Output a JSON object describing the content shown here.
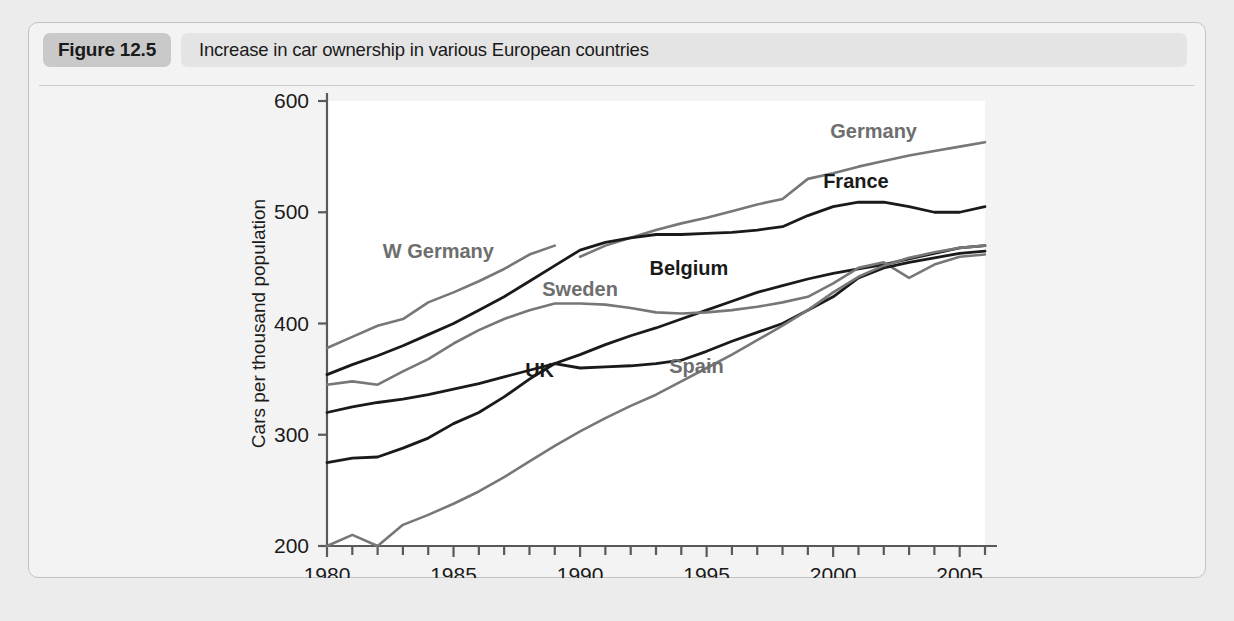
{
  "figure": {
    "tag": "Figure 12.5",
    "title": "Increase in car ownership in various European countries"
  },
  "chart_data": {
    "type": "line",
    "title": "Increase in car ownership in various European countries",
    "xlabel": "",
    "ylabel": "Cars per thousand population",
    "xlim": [
      1980,
      2006
    ],
    "ylim": [
      200,
      600
    ],
    "yticks": [
      200,
      300,
      400,
      500,
      600
    ],
    "ytick_labels": [
      "200",
      "300",
      "400",
      "500",
      "600"
    ],
    "xticks": [
      1980,
      1985,
      1990,
      1995,
      2000,
      2005
    ],
    "xtick_labels": [
      "1980",
      "1985",
      "1990",
      "1995",
      "2000",
      "2005"
    ],
    "xtick_minor_step": 1,
    "grid": false,
    "legend": "inline-labels",
    "colors": {
      "dark": "#1a1a1a",
      "gray": "#777777"
    },
    "series": [
      {
        "name": "W Germany",
        "color": "gray",
        "label_x": 1984.4,
        "label_y": 465,
        "x": [
          1980,
          1981,
          1982,
          1983,
          1984,
          1985,
          1986,
          1987,
          1988,
          1989
        ],
        "values": [
          378,
          388,
          398,
          404,
          419,
          428,
          438,
          449,
          462,
          470
        ]
      },
      {
        "name": "Germany",
        "color": "gray",
        "label_x": 2001.6,
        "label_y": 573,
        "x": [
          1990,
          1991,
          1992,
          1993,
          1994,
          1995,
          1996,
          1997,
          1998,
          1999,
          2000,
          2001,
          2002,
          2003,
          2004,
          2005,
          2006
        ],
        "values": [
          460,
          470,
          477,
          484,
          490,
          495,
          501,
          507,
          512,
          530,
          535,
          541,
          546,
          551,
          555,
          559,
          563
        ]
      },
      {
        "name": "France",
        "color": "dark",
        "label_x": 2000.9,
        "label_y": 528,
        "x": [
          1980,
          1981,
          1982,
          1983,
          1984,
          1985,
          1986,
          1987,
          1988,
          1989,
          1990,
          1991,
          1992,
          1993,
          1994,
          1995,
          1996,
          1997,
          1998,
          1999,
          2000,
          2001,
          2002,
          2003,
          2004,
          2005,
          2006
        ],
        "values": [
          354,
          363,
          371,
          380,
          390,
          400,
          412,
          424,
          438,
          452,
          466,
          473,
          477,
          480,
          480,
          481,
          482,
          484,
          487,
          497,
          505,
          509,
          509,
          505,
          500,
          500,
          505
        ]
      },
      {
        "name": "Belgium",
        "color": "dark",
        "label_x": 1994.3,
        "label_y": 450,
        "x": [
          1980,
          1981,
          1982,
          1983,
          1984,
          1985,
          1986,
          1987,
          1988,
          1989,
          1990,
          1991,
          1992,
          1993,
          1994,
          1995,
          1996,
          1997,
          1998,
          1999,
          2000,
          2001,
          2002,
          2003,
          2004,
          2005,
          2006
        ],
        "values": [
          320,
          325,
          329,
          332,
          336,
          341,
          346,
          352,
          358,
          364,
          372,
          381,
          389,
          396,
          404,
          412,
          420,
          428,
          434,
          440,
          445,
          449,
          453,
          458,
          463,
          468,
          470
        ]
      },
      {
        "name": "Sweden",
        "color": "gray",
        "label_x": 1990.0,
        "label_y": 431,
        "x": [
          1980,
          1981,
          1982,
          1983,
          1984,
          1985,
          1986,
          1987,
          1988,
          1989,
          1990,
          1991,
          1992,
          1993,
          1994,
          1995,
          1996,
          1997,
          1998,
          1999,
          2000,
          2001,
          2002,
          2003,
          2004,
          2005,
          2006
        ],
        "values": [
          345,
          348,
          345,
          357,
          368,
          382,
          394,
          404,
          412,
          418,
          418,
          417,
          414,
          410,
          409,
          410,
          412,
          415,
          419,
          424,
          436,
          450,
          455,
          441,
          453,
          460,
          462
        ]
      },
      {
        "name": "UK",
        "color": "dark",
        "label_x": 1988.4,
        "label_y": 358,
        "x": [
          1980,
          1981,
          1982,
          1983,
          1984,
          1985,
          1986,
          1987,
          1988,
          1989,
          1990,
          1991,
          1992,
          1993,
          1994,
          1995,
          1996,
          1997,
          1998,
          1999,
          2000,
          2001,
          2002,
          2003,
          2004,
          2005,
          2006
        ],
        "values": [
          275,
          279,
          280,
          288,
          297,
          310,
          320,
          334,
          350,
          364,
          360,
          361,
          362,
          364,
          367,
          375,
          384,
          392,
          400,
          412,
          424,
          441,
          450,
          455,
          459,
          463,
          465
        ]
      },
      {
        "name": "Spain",
        "color": "gray",
        "label_x": 1994.6,
        "label_y": 362,
        "x": [
          1980,
          1981,
          1982,
          1983,
          1984,
          1985,
          1986,
          1987,
          1988,
          1989,
          1990,
          1991,
          1992,
          1993,
          1994,
          1995,
          1996,
          1997,
          1998,
          1999,
          2000,
          2001,
          2002,
          2003,
          2004,
          2005,
          2006
        ],
        "values": [
          200,
          210,
          200,
          219,
          228,
          238,
          249,
          262,
          276,
          290,
          303,
          315,
          326,
          336,
          348,
          360,
          372,
          385,
          398,
          412,
          428,
          442,
          452,
          459,
          464,
          468,
          470
        ]
      }
    ]
  }
}
